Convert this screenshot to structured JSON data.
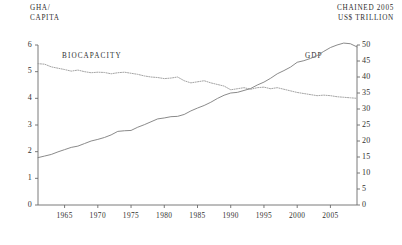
{
  "axes": {
    "left_title": "GHA/\nCAPITA",
    "right_title": "CHAINED 2005\nUS$ TRILLION",
    "left_ticks": [
      "6",
      "5",
      "4",
      "3",
      "2",
      "1",
      "0"
    ],
    "right_ticks": [
      "50",
      "45",
      "40",
      "35",
      "30",
      "25",
      "20",
      "15",
      "10",
      "5",
      "0"
    ],
    "x_ticks": [
      "1965",
      "1970",
      "1975",
      "1980",
      "1985",
      "1990",
      "1995",
      "2000",
      "2005"
    ]
  },
  "series_labels": {
    "biocapacity": "BIOCAPACITY",
    "gdp": "GDP"
  },
  "colors": {
    "axis": "#6b6b6b",
    "biocapacity": "#9a9a9a",
    "gdp": "#7d7d7d",
    "text": "#2b2b2b"
  },
  "chart_data": {
    "type": "line",
    "title": "",
    "xlabel": "",
    "ylabel": "GHA/CAPITA",
    "y2label": "CHAINED 2005 US$ TRILLION",
    "grid": false,
    "legend": "inline-annotations",
    "xlim": [
      1961,
      2009
    ],
    "ylim": [
      0,
      6
    ],
    "y2lim": [
      0,
      50
    ],
    "x": [
      1961,
      1962,
      1963,
      1964,
      1965,
      1966,
      1967,
      1968,
      1969,
      1970,
      1971,
      1972,
      1973,
      1974,
      1975,
      1976,
      1977,
      1978,
      1979,
      1980,
      1981,
      1982,
      1983,
      1984,
      1985,
      1986,
      1987,
      1988,
      1989,
      1990,
      1991,
      1992,
      1993,
      1994,
      1995,
      1996,
      1997,
      1998,
      1999,
      2000,
      2001,
      2002,
      2003,
      2004,
      2005,
      2006,
      2007,
      2008,
      2009
    ],
    "series": [
      {
        "name": "BIOCAPACITY",
        "axis": "left",
        "style": "dotted",
        "unit": "gha per capita",
        "values": [
          5.3,
          5.28,
          5.18,
          5.13,
          5.08,
          5.02,
          5.06,
          5.0,
          4.96,
          4.98,
          4.97,
          4.92,
          4.96,
          4.98,
          4.94,
          4.9,
          4.84,
          4.8,
          4.78,
          4.74,
          4.76,
          4.8,
          4.66,
          4.58,
          4.62,
          4.66,
          4.58,
          4.52,
          4.46,
          4.32,
          4.36,
          4.4,
          4.34,
          4.4,
          4.42,
          4.36,
          4.4,
          4.34,
          4.28,
          4.22,
          4.18,
          4.14,
          4.1,
          4.12,
          4.1,
          4.06,
          4.04,
          4.02,
          4.0
        ]
      },
      {
        "name": "GDP",
        "axis": "right",
        "style": "solid",
        "unit": "trillion chained 2005 US$",
        "values": [
          14.8,
          15.3,
          15.8,
          16.6,
          17.3,
          18.0,
          18.4,
          19.2,
          20.0,
          20.5,
          21.1,
          21.9,
          23.0,
          23.2,
          23.3,
          24.3,
          25.1,
          26.0,
          26.9,
          27.2,
          27.6,
          27.7,
          28.3,
          29.4,
          30.3,
          31.1,
          32.1,
          33.3,
          34.3,
          35.0,
          35.2,
          35.8,
          36.4,
          37.5,
          38.4,
          39.6,
          41.0,
          42.0,
          43.1,
          44.6,
          45.1,
          45.8,
          46.7,
          48.0,
          49.2,
          50.0,
          50.6,
          50.4,
          49.4
        ]
      }
    ]
  }
}
